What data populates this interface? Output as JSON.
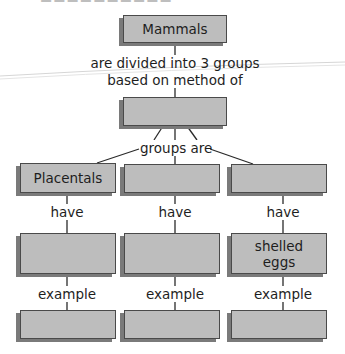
{
  "diagram": {
    "title_box": "Mammals",
    "link_top": [
      "are divided into 3 groups",
      "based on method of"
    ],
    "method_box": "",
    "link_groups": "groups are",
    "columns": [
      {
        "group": "Placentals",
        "link_have": "have",
        "trait": "",
        "link_example": "example",
        "example": ""
      },
      {
        "group": "",
        "link_have": "have",
        "trait": "",
        "link_example": "example",
        "example": ""
      },
      {
        "group": "",
        "link_have": "have",
        "trait": "shelled eggs",
        "trait_lines": [
          "shelled",
          "eggs"
        ],
        "link_example": "example",
        "example": ""
      }
    ]
  },
  "colors": {
    "box_fill": "#bdbdbd",
    "box_border": "#4a4a4a",
    "box_shadow": "#7a7a7a",
    "line": "#2a2a2a",
    "text": "#1e1e1e"
  }
}
